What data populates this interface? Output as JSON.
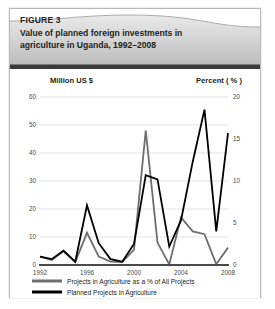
{
  "figure": {
    "label": "FIGURE 3",
    "title_line1": "Value of planned foreign investments in",
    "title_line2": "agriculture in Uganda, 1992–2008"
  },
  "colors": {
    "black_series": "#000000",
    "gray_series": "#6e6e6e",
    "grid": "#d7d7d7",
    "axis": "#4a4a4a",
    "header_band": "#c9c9c9",
    "header_rule": "#3a3a3a",
    "card_border": "#b8b8b8",
    "text": "#231f20"
  },
  "chart_data": {
    "type": "line",
    "title": "Value of planned foreign investments in agriculture in Uganda, 1992–2008",
    "xlabel": "",
    "left_axis_label": "Million US $",
    "right_axis_label": "Percent ( % )",
    "x": [
      1992,
      1993,
      1994,
      1995,
      1996,
      1997,
      1998,
      1999,
      2000,
      2001,
      2002,
      2003,
      2004,
      2005,
      2006,
      2007,
      2008
    ],
    "xticks": [
      1992,
      1996,
      2000,
      2004,
      2008
    ],
    "xtick_labels": [
      "1992",
      "1996",
      "2000",
      "2004",
      "2008"
    ],
    "ylim": [
      0,
      60
    ],
    "yticks": [
      0,
      10,
      20,
      30,
      40,
      50,
      60
    ],
    "ytick_labels": [
      "0",
      "10",
      "20",
      "30",
      "40",
      "50",
      "60"
    ],
    "y2lim": [
      0,
      20
    ],
    "y2ticks": [
      0,
      5,
      10,
      15,
      20
    ],
    "y2tick_labels": [
      "0",
      "5",
      "10",
      "15",
      "20"
    ],
    "grid": true,
    "legend_position": "below",
    "series": [
      {
        "name": "Planned Projects in Agriculture",
        "axis": "right",
        "units": "percent",
        "color": "#000000",
        "values": [
          1.0,
          0.7,
          1.7,
          0.4,
          7.1,
          2.6,
          0.7,
          0.4,
          2.5,
          10.7,
          10.2,
          2.2,
          5.3,
          12.3,
          18.5,
          4.0,
          15.7
        ]
      },
      {
        "name": "Projects in Agriculture as a % of All Projects",
        "axis": "left",
        "units": "million_usd",
        "color": "#6e6e6e",
        "values": [
          3.0,
          1.8,
          5.0,
          1.0,
          11.5,
          3.0,
          1.2,
          1.0,
          5.5,
          48.0,
          8.0,
          0.2,
          17.0,
          12.0,
          11.0,
          0.3,
          6.2
        ]
      }
    ]
  },
  "legend": {
    "items": [
      {
        "label": "Projects in Agriculture as a % of All Projects",
        "color": "#6e6e6e"
      },
      {
        "label": "Planned Projects in Agriculture",
        "color": "#000000"
      }
    ]
  }
}
